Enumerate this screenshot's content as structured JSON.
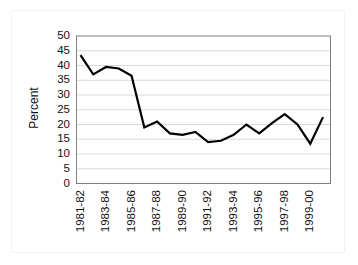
{
  "chart_data": {
    "type": "line",
    "title": "",
    "xlabel": "",
    "ylabel": "Percent",
    "ylim": [
      0,
      50
    ],
    "ytick_step": 5,
    "yticks": [
      50,
      45,
      40,
      35,
      30,
      25,
      20,
      15,
      10,
      5,
      0
    ],
    "grid": true,
    "grid_axis": "y",
    "legend": "none",
    "line_color": "#000000",
    "grid_color": "#d9d9d9",
    "axis_color": "#808080",
    "background_color": "#ffffff",
    "categories": [
      "1981-82",
      "1982-83",
      "1983-84",
      "1984-85",
      "1985-86",
      "1986-87",
      "1987-88",
      "1988-89",
      "1989-90",
      "1990-91",
      "1991-92",
      "1992-93",
      "1993-94",
      "1994-95",
      "1995-96",
      "1996-97",
      "1997-98",
      "1998-99",
      "1999-00"
    ],
    "xtick_labels": [
      "1981-82",
      "1983-84",
      "1985-86",
      "1987-88",
      "1989-90",
      "1991-92",
      "1993-94",
      "1995-96",
      "1997-98",
      "1999-00"
    ],
    "xtick_label_rotation": -90,
    "values": [
      43.5,
      37.0,
      39.5,
      39.0,
      36.5,
      19.0,
      21.0,
      17.0,
      16.5,
      17.5,
      14.0,
      14.5,
      16.5,
      20.0,
      17.0,
      20.5,
      23.5,
      20.0,
      13.5
    ],
    "series": [
      {
        "name": "Percent",
        "values": [
          43.5,
          37.0,
          39.5,
          39.0,
          36.5,
          19.0,
          21.0,
          17.0,
          16.5,
          17.5,
          14.0,
          14.5,
          16.5,
          20.0,
          17.0,
          20.5,
          23.5,
          20.0,
          13.5
        ]
      }
    ],
    "final_value": 22.5,
    "note_point_count": 20
  }
}
